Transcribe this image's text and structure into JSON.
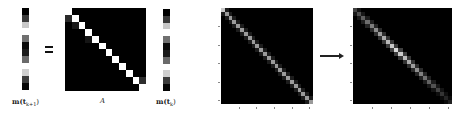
{
  "equation": {
    "lhs_vector": {
      "label": "m(t",
      "label_sub": "k+1",
      "label_close": ")",
      "cells": [
        "#000000",
        "#3a3a3a",
        "#c8c8c8",
        "#ffffff",
        "#707070",
        "#0a0a0a",
        "#1a1a1a",
        "#6a6a6a",
        "#ffffff",
        "#cfcfcf",
        "#3c3c3c",
        "#050505"
      ]
    },
    "equals_sign": "=",
    "matrix_A": {
      "label": "A",
      "size": 12,
      "diagonal_color": "#ffffff",
      "offdiag": [
        {
          "row": 1,
          "col": 0,
          "color": "#2a2a2a"
        },
        {
          "row": 2,
          "col": 1,
          "color": "#1a1a1a"
        },
        {
          "row": 4,
          "col": 3,
          "color": "#151515"
        },
        {
          "row": 10,
          "col": 11,
          "color": "#2e2e2e"
        }
      ]
    },
    "rhs_vector": {
      "label": "m(t",
      "label_sub": "k",
      "label_close": ")",
      "cells": [
        "#000000",
        "#3a3a3a",
        "#c8c8c8",
        "#ffffff",
        "#707070",
        "#0a0a0a",
        "#1a1a1a",
        "#6a6a6a",
        "#ffffff",
        "#cfcfcf",
        "#3c3c3c",
        "#050505"
      ]
    }
  },
  "transition": {
    "before_matrix": {
      "size": 24,
      "diagonal_color": "#9a9a9a",
      "first_cell_color": "#c8c8c8",
      "left_ticks": 5,
      "bottom_ticks": 5
    },
    "arrow": "→",
    "after_matrix": {
      "size": 24,
      "diagonal_profile": "brighter in middle, fading at ends",
      "left_ticks": 5,
      "bottom_ticks": 5
    }
  }
}
